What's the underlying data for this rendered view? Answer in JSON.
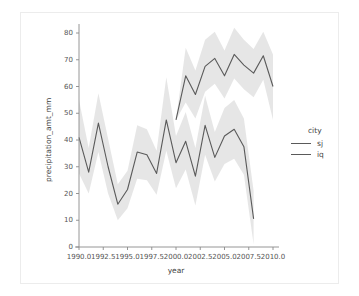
{
  "figure": {
    "background_color": "#ffffff",
    "frame_color": "#ececec",
    "line_color": "#5a5a5a",
    "band_color": "#e2e2e2"
  },
  "legend": {
    "title": "city",
    "entries": [
      {
        "label": "sj",
        "color": "#5a5a5a"
      },
      {
        "label": "iq",
        "color": "#5a5a5a"
      }
    ]
  },
  "axes": {
    "xlabel": "year",
    "ylabel": "precipitation_amt_mm",
    "xticks": [
      "1990.0",
      "1992.5",
      "1995.0",
      "1997.5",
      "2000.0",
      "2002.5",
      "2005.0",
      "2007.5",
      "2010.0"
    ],
    "xtick_values": [
      1990.0,
      1992.5,
      1995.0,
      1997.5,
      2000.0,
      2002.5,
      2005.0,
      2007.5,
      2010.0
    ],
    "yticks": [
      "0",
      "10",
      "20",
      "30",
      "40",
      "50",
      "60",
      "70",
      "80"
    ],
    "ytick_values": [
      0,
      10,
      20,
      30,
      40,
      50,
      60,
      70,
      80
    ]
  },
  "chart_data": {
    "type": "line",
    "title": "",
    "xlabel": "year",
    "ylabel": "precipitation_amt_mm",
    "xlim": [
      1989.2,
      2010.8
    ],
    "ylim": [
      -3,
      84
    ],
    "grid": false,
    "legend_position": "right",
    "legend_title": "city",
    "band_type": "confidence_interval",
    "series": [
      {
        "name": "sj",
        "color": "#5a5a5a",
        "x": [
          1990,
          1991,
          1992,
          1993,
          1994,
          1995,
          1996,
          1997,
          1998,
          1999,
          2000,
          2001,
          2002,
          2003,
          2004,
          2005,
          2006,
          2007,
          2008
        ],
        "y": [
          41.0,
          28.0,
          46.3,
          30.0,
          16.0,
          21.5,
          35.5,
          34.5,
          27.5,
          47.5,
          31.5,
          39.5,
          26.5,
          45.5,
          33.5,
          41.5,
          44.0,
          37.5,
          10.5
        ],
        "y_lower": [
          27.5,
          20.0,
          35.5,
          20.0,
          10.0,
          14.5,
          25.5,
          25.0,
          19.5,
          36.0,
          22.0,
          29.0,
          15.5,
          34.5,
          24.5,
          31.0,
          33.0,
          27.0,
          1.0
        ],
        "y_upper": [
          55.0,
          37.0,
          57.5,
          40.5,
          23.5,
          28.5,
          45.5,
          44.0,
          36.0,
          63.5,
          41.5,
          50.5,
          37.0,
          56.5,
          43.0,
          52.0,
          55.0,
          48.0,
          21.0
        ]
      },
      {
        "name": "iq",
        "color": "#5a5a5a",
        "x": [
          2000,
          2001,
          2002,
          2003,
          2004,
          2005,
          2006,
          2007,
          2008,
          2009,
          2010
        ],
        "y": [
          47.5,
          64.0,
          57.0,
          67.5,
          70.5,
          64.0,
          72.0,
          68.0,
          65.0,
          71.5,
          60.0
        ],
        "y_lower": [
          47.5,
          54.0,
          48.0,
          58.0,
          61.0,
          55.5,
          63.0,
          59.0,
          56.0,
          62.5,
          47.5
        ],
        "y_upper": [
          47.5,
          74.5,
          66.0,
          77.5,
          80.5,
          73.5,
          82.0,
          77.5,
          74.0,
          80.5,
          72.0
        ]
      }
    ]
  }
}
